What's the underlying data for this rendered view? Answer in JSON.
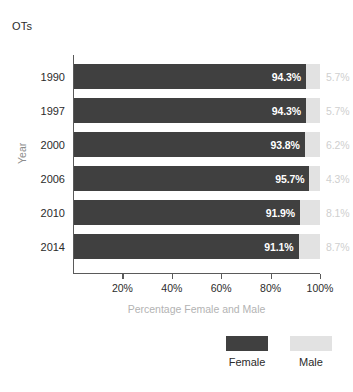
{
  "chart_data": {
    "type": "bar",
    "orientation": "horizontal",
    "stacked": true,
    "title": "OTs",
    "xlabel": "Percentage Female and Male",
    "ylabel": "Year",
    "categories": [
      "1990",
      "1997",
      "2000",
      "2006",
      "2010",
      "2014"
    ],
    "series": [
      {
        "name": "Female",
        "color": "#404040",
        "values": [
          94.3,
          94.3,
          93.8,
          95.7,
          91.9,
          91.1
        ],
        "labels": [
          "94.3%",
          "94.3%",
          "93.8%",
          "95.7%",
          "91.9%",
          "91.1%"
        ]
      },
      {
        "name": "Male",
        "color": "#e2e2e2",
        "values": [
          5.7,
          5.7,
          6.2,
          4.3,
          8.1,
          8.7
        ],
        "labels": [
          "5.7%",
          "5.7%",
          "6.2%",
          "4.3%",
          "8.1%",
          "8.7%"
        ]
      }
    ],
    "xlim": [
      0,
      100
    ],
    "xticks": [
      20,
      40,
      60,
      80,
      100
    ],
    "xtick_labels": [
      "20%",
      "40%",
      "60%",
      "80%",
      "100%"
    ],
    "grid": false,
    "legend_position": "bottom-right",
    "legend": [
      "Female",
      "Male"
    ]
  },
  "colors": {
    "female": "#404040",
    "male": "#e2e2e2",
    "female_label_text": "#ffffff",
    "male_label_text": "#cfcfcf",
    "axis": "#5a5a5a",
    "title_text": "#2b2b2b",
    "xaxis_title_text": "#b3b3b3",
    "yaxis_title_text": "#8c8c8c",
    "background": "#ffffff"
  }
}
